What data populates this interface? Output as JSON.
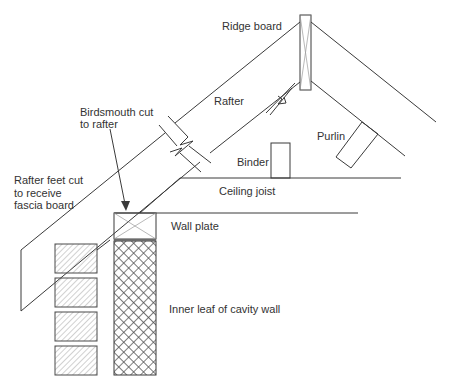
{
  "labels": {
    "ridge_board": "Ridge board",
    "rafter": "Rafter",
    "birdsmouth_line1": "Birdsmouth cut",
    "birdsmouth_line2": "to rafter",
    "purlin": "Purlin",
    "binder": "Binder",
    "ceiling_joist": "Ceiling joist",
    "rafter_feet_line1": "Rafter feet cut",
    "rafter_feet_line2": "to receive",
    "rafter_feet_line3": "fascia board",
    "wall_plate": "Wall plate",
    "inner_leaf": "Inner leaf of cavity wall"
  },
  "colors": {
    "line": "#3a3a3a",
    "text": "#333333",
    "hatch": "#9a9a9a",
    "background": "#ffffff"
  }
}
